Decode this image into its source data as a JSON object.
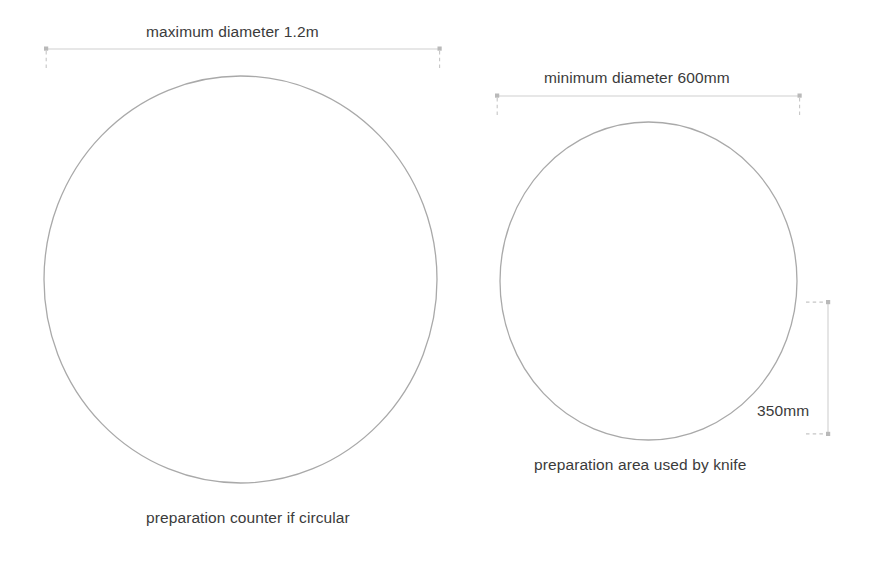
{
  "diagram": {
    "background_color": "#ffffff",
    "stroke_color": "#a9a9a9",
    "dimension_line_color": "#c9c9c9",
    "text_color": "#3b3b3b",
    "shapes": [
      {
        "name": "large-circle",
        "role": "preparation counter if circular",
        "cx": 240.5,
        "cy": 279.5,
        "rx": 196.5,
        "ry": 203.5
      },
      {
        "name": "small-circle",
        "role": "preparation area used by knife",
        "cx": 648.5,
        "cy": 281.0,
        "rx": 148.5,
        "ry": 159.0
      }
    ],
    "dimensions": [
      {
        "name": "max-diameter",
        "label": "maximum diameter 1.2m",
        "value": 1.2,
        "unit": "m",
        "orientation": "horizontal",
        "line_y": 49,
        "x_start": 46,
        "x_end": 440,
        "label_x": 146,
        "label_y": 24
      },
      {
        "name": "min-diameter",
        "label": "minimum diameter 600mm",
        "value": 600,
        "unit": "mm",
        "orientation": "horizontal",
        "line_y": 96,
        "x_start": 497,
        "x_end": 800,
        "label_x": 544,
        "label_y": 70
      },
      {
        "name": "knife-reach-depth",
        "label": "350mm",
        "value": 350,
        "unit": "mm",
        "orientation": "vertical",
        "line_x": 828,
        "y_start": 302,
        "y_end": 434,
        "label_x": 757,
        "label_y": 403
      }
    ],
    "captions": [
      {
        "name": "caption-large-circle",
        "text": "preparation counter if circular",
        "x": 146,
        "y": 510
      },
      {
        "name": "caption-small-circle",
        "text": "preparation area used by knife",
        "x": 534,
        "y": 457
      }
    ]
  },
  "labels": {
    "max_diameter": "maximum diameter 1.2m",
    "min_diameter": "minimum diameter 600mm",
    "knife_depth": "350mm",
    "caption_large": "preparation counter if circular",
    "caption_small": "preparation area used by knife"
  }
}
